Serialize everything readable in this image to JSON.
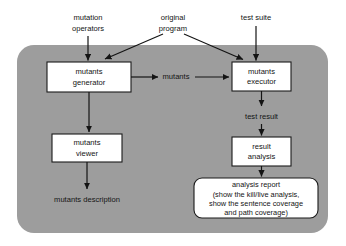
{
  "diagram": {
    "panel": {
      "name": "tool-boundary",
      "fill": "#9d9d9d"
    },
    "external_inputs": [
      {
        "id": "mutation-operators",
        "lines": [
          "mutation",
          "operators"
        ]
      },
      {
        "id": "original-program",
        "lines": [
          "original",
          "program"
        ]
      },
      {
        "id": "test-suite",
        "lines": [
          "test suite"
        ]
      }
    ],
    "nodes": [
      {
        "id": "mutants-generator",
        "lines": [
          "mutants",
          "generator"
        ]
      },
      {
        "id": "mutants-executor",
        "lines": [
          "mutants",
          "executor"
        ]
      },
      {
        "id": "mutants-viewer",
        "lines": [
          "mutants",
          "viewer"
        ]
      },
      {
        "id": "result-analysis",
        "lines": [
          "result",
          "analysis"
        ]
      }
    ],
    "report": {
      "id": "analysis-report",
      "lines": [
        "analysis report",
        "(show the kill/live analysis,",
        "show the sentence coverage",
        "and path coverage)"
      ]
    },
    "edge_labels": [
      {
        "id": "mutants-label",
        "text": "mutants"
      },
      {
        "id": "test-result-label",
        "text": "test result"
      },
      {
        "id": "mutants-description-label",
        "text": "mutants description"
      }
    ]
  }
}
